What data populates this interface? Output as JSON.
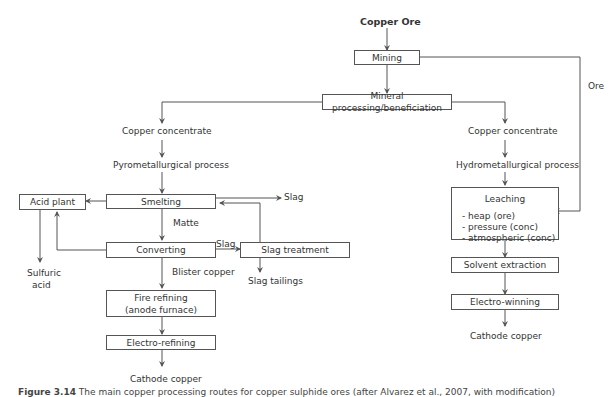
{
  "diagram": {
    "title": "Copper Ore",
    "nodes": {
      "mining": "Mining",
      "mineral_processing": "Mineral processing/beneficiation",
      "smelting": "Smelting",
      "acid_plant": "Acid plant",
      "converting": "Converting",
      "slag_treatment": "Slag treatment",
      "fire_refining_line1": "Fire refining",
      "fire_refining_line2": "(anode furnace)",
      "electro_refining": "Electro-refining",
      "leaching": "Leaching",
      "leaching_options": [
        "- heap (ore)",
        "- pressure (conc)",
        "- atmospheric (conc)"
      ],
      "solvent_extraction": "Solvent extraction",
      "electro_winning": "Electro-winning"
    },
    "labels": {
      "copper_concentrate_left": "Copper concentrate",
      "pyrometallurgical": "Pyrometallurgical process",
      "copper_concentrate_right": "Copper concentrate",
      "hydrometallurgical": "Hydrometallurgical process",
      "ore": "Ore",
      "slag_smelting": "Slag",
      "matte": "Matte",
      "slag_converting": "Slag",
      "blister_copper": "Blister copper",
      "slag_tailings": "Slag tailings",
      "sulfuric_acid_line1": "Sulfuric",
      "sulfuric_acid_line2": "acid",
      "cathode_copper_left": "Cathode copper",
      "cathode_copper_right": "Cathode copper"
    }
  },
  "caption": {
    "number": "Figure 3.14",
    "text": "The main copper processing routes for copper sulphide ores (after Alvarez et al., 2007, with modification)"
  },
  "colors": {
    "line": "#555555",
    "text": "#333333"
  }
}
